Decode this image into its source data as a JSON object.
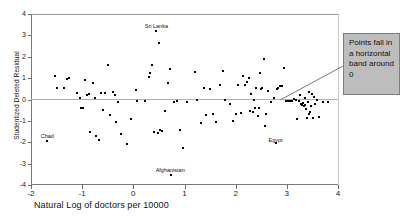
{
  "chart_data": {
    "type": "scatter",
    "title": "",
    "xlabel": "Natural Log of doctors per 10000",
    "ylabel": "Studentized Deleted Residual",
    "xlim": [
      -2,
      4
    ],
    "ylim": [
      -4,
      4
    ],
    "xticks": [
      "-2",
      "-1",
      "0",
      "1",
      "2",
      "3",
      "4"
    ],
    "yticks": [
      "4",
      "3",
      "2",
      "1",
      "0",
      "-1",
      "-2",
      "-3",
      "-4"
    ],
    "grid": false,
    "legend": null,
    "reference_line": {
      "y": 0,
      "label": "zero residual line"
    },
    "point_labels": [
      {
        "text": "Sri Lanka",
        "x": 0.45,
        "y": 3.45
      },
      {
        "text": "Chad",
        "x": -1.68,
        "y": -1.72
      },
      {
        "text": "Afghanistan",
        "x": 0.72,
        "y": -3.28
      },
      {
        "text": "Egypt",
        "x": 2.78,
        "y": -1.88
      }
    ],
    "points": [
      [
        -1.68,
        -1.92
      ],
      [
        -1.53,
        1.12
      ],
      [
        -1.49,
        0.53
      ],
      [
        -1.35,
        0.55
      ],
      [
        -1.3,
        0.97
      ],
      [
        -1.25,
        1.02
      ],
      [
        -1.1,
        0.3
      ],
      [
        -1.05,
        0.05
      ],
      [
        -1.02,
        -0.38
      ],
      [
        -0.98,
        -0.4
      ],
      [
        -0.95,
        0.89
      ],
      [
        -0.9,
        0.19
      ],
      [
        -0.86,
        0.25
      ],
      [
        -0.84,
        -1.52
      ],
      [
        -0.79,
        0.75
      ],
      [
        -0.75,
        0.07
      ],
      [
        -0.72,
        -1.72
      ],
      [
        -0.68,
        -1.9
      ],
      [
        -0.63,
        0.32
      ],
      [
        -0.6,
        -0.48
      ],
      [
        -0.55,
        0.31
      ],
      [
        -0.5,
        1.63
      ],
      [
        -0.46,
        -0.72
      ],
      [
        -0.4,
        0.35
      ],
      [
        -0.35,
        0.22
      ],
      [
        -0.33,
        -1.06
      ],
      [
        -0.3,
        -0.12
      ],
      [
        -0.25,
        -1.62
      ],
      [
        -0.12,
        -2.1
      ],
      [
        -0.05,
        -0.93
      ],
      [
        0.05,
        0.45
      ],
      [
        0.08,
        -0.06
      ],
      [
        0.22,
        -0.07
      ],
      [
        0.3,
        1.07
      ],
      [
        0.33,
        1.22
      ],
      [
        0.36,
        1.6
      ],
      [
        0.4,
        -1.5
      ],
      [
        0.45,
        3.22
      ],
      [
        0.48,
        -1.58
      ],
      [
        0.5,
        2.64
      ],
      [
        0.52,
        -1.45
      ],
      [
        0.56,
        -1.49
      ],
      [
        0.62,
        -0.55
      ],
      [
        0.68,
        0.78
      ],
      [
        0.72,
        1.45
      ],
      [
        0.74,
        -3.55
      ],
      [
        0.8,
        -0.12
      ],
      [
        0.85,
        -0.08
      ],
      [
        0.92,
        -1.42
      ],
      [
        0.97,
        -2.28
      ],
      [
        1.05,
        -0.1
      ],
      [
        1.2,
        1.28
      ],
      [
        1.25,
        -0.02
      ],
      [
        1.32,
        -1.12
      ],
      [
        1.38,
        0.52
      ],
      [
        1.42,
        -0.72
      ],
      [
        1.5,
        0.5
      ],
      [
        1.55,
        -0.7
      ],
      [
        1.62,
        -1.05
      ],
      [
        1.7,
        0.68
      ],
      [
        1.75,
        1.32
      ],
      [
        1.8,
        -0.03
      ],
      [
        1.88,
        -0.22
      ],
      [
        1.95,
        -1.02
      ],
      [
        2.0,
        -0.68
      ],
      [
        2.05,
        0.68
      ],
      [
        2.1,
        -0.65
      ],
      [
        2.14,
        1.1
      ],
      [
        2.18,
        0.7
      ],
      [
        2.22,
        0.83
      ],
      [
        2.26,
        1.02
      ],
      [
        2.28,
        -0.52
      ],
      [
        2.3,
        0.25
      ],
      [
        2.33,
        -0.6
      ],
      [
        2.36,
        0.0
      ],
      [
        2.4,
        0.52
      ],
      [
        2.44,
        -0.78
      ],
      [
        2.48,
        1.22
      ],
      [
        2.5,
        0.5
      ],
      [
        2.52,
        0.54
      ],
      [
        2.56,
        1.9
      ],
      [
        2.58,
        -1.22
      ],
      [
        2.6,
        -0.68
      ],
      [
        2.64,
        0.42
      ],
      [
        2.7,
        -0.12
      ],
      [
        2.74,
        0.05
      ],
      [
        2.78,
        -2.05
      ],
      [
        2.8,
        0.48
      ],
      [
        2.83,
        0.55
      ],
      [
        2.86,
        0.62
      ],
      [
        2.9,
        0.62
      ],
      [
        2.94,
        1.46
      ],
      [
        2.98,
        -0.05
      ],
      [
        3.02,
        -0.07
      ],
      [
        3.06,
        -0.06
      ],
      [
        3.1,
        -0.05
      ],
      [
        3.14,
        0.03
      ],
      [
        3.18,
        -0.04
      ],
      [
        3.2,
        -0.92
      ],
      [
        3.24,
        -0.08
      ],
      [
        3.26,
        0.2
      ],
      [
        3.28,
        -0.22
      ],
      [
        3.3,
        -0.28
      ],
      [
        3.32,
        -0.18
      ],
      [
        3.34,
        -0.32
      ],
      [
        3.36,
        -0.25
      ],
      [
        3.38,
        -0.45
      ],
      [
        3.4,
        -0.85
      ],
      [
        3.42,
        -0.12
      ],
      [
        3.44,
        0.36
      ],
      [
        3.46,
        -0.6
      ],
      [
        3.48,
        -0.3
      ],
      [
        3.5,
        0.28
      ],
      [
        3.52,
        -0.88
      ],
      [
        3.54,
        0.1
      ],
      [
        3.56,
        -0.2
      ],
      [
        3.58,
        -0.02
      ],
      [
        3.62,
        -0.82
      ],
      [
        3.7,
        -0.1
      ],
      [
        3.8,
        -0.13
      ],
      [
        2.46,
        -0.38
      ],
      [
        2.38,
        -0.42
      ],
      [
        3.44,
        -0.7
      ],
      [
        3.35,
        0.06
      ]
    ]
  },
  "callout": {
    "text": "Points fall in a horizontal band around 0",
    "background_color": "#bdbdbd",
    "border_color": "#7d7d7d",
    "leader_target": {
      "x": 2.72,
      "y": -0.02
    }
  }
}
